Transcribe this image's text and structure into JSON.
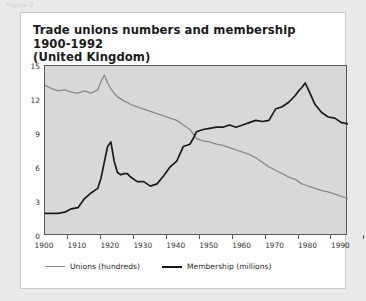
{
  "page": {
    "corner_stub": "Figure 2"
  },
  "card": {
    "title_line1": "Trade unions numbers and membership 1900-1992",
    "title_line2": "(United Kingdom)"
  },
  "legend": {
    "items": [
      {
        "label": "Unions (hundreds)",
        "color": "#8a8a8a",
        "style": "thin"
      },
      {
        "label": "Membership (millions)",
        "color": "#1a1a1a",
        "style": "thick"
      }
    ]
  },
  "colors": {
    "page_background": "#e9e9e9",
    "card_background": "#ffffff",
    "card_border": "#c9c9c9",
    "plot_background": "#d8d8d8",
    "plot_frame": "#5a5a5a",
    "unions_line": "#8a8a8a",
    "membership_line": "#1a1a1a",
    "text": "#1b1b1b"
  },
  "chart_data": {
    "type": "line",
    "title": "Trade unions numbers and membership 1900-1992 (United Kingdom)",
    "subtitle": "(United Kingdom)",
    "xlabel": "",
    "ylabel": "",
    "xlim": [
      1900,
      1992
    ],
    "ylim": [
      0,
      15
    ],
    "grid": false,
    "legend_position": "bottom-left",
    "xticks": [
      1900,
      1910,
      1920,
      1930,
      1940,
      1950,
      1960,
      1970,
      1980,
      1990
    ],
    "yticks": [
      0,
      3,
      6,
      9,
      12,
      15
    ],
    "x": [
      1900,
      1902,
      1904,
      1906,
      1908,
      1910,
      1912,
      1914,
      1916,
      1917,
      1918,
      1919,
      1920,
      1921,
      1922,
      1923,
      1924,
      1925,
      1926,
      1928,
      1930,
      1932,
      1934,
      1936,
      1938,
      1940,
      1942,
      1944,
      1945,
      1946,
      1948,
      1950,
      1952,
      1954,
      1956,
      1958,
      1960,
      1962,
      1964,
      1966,
      1968,
      1970,
      1972,
      1974,
      1976,
      1977,
      1978,
      1979,
      1980,
      1982,
      1984,
      1986,
      1988,
      1990,
      1992
    ],
    "series": [
      {
        "name": "Unions (hundreds)",
        "units": "hundreds",
        "color": "#8a8a8a",
        "values": [
          13.3,
          13.0,
          12.8,
          12.9,
          12.7,
          12.6,
          12.8,
          12.6,
          12.9,
          13.6,
          14.2,
          13.5,
          13.0,
          12.6,
          12.3,
          12.1,
          11.9,
          11.8,
          11.6,
          11.4,
          11.2,
          11.0,
          10.8,
          10.6,
          10.4,
          10.2,
          9.8,
          9.4,
          9.0,
          8.6,
          8.4,
          8.3,
          8.1,
          8.0,
          7.8,
          7.6,
          7.4,
          7.2,
          6.9,
          6.5,
          6.1,
          5.8,
          5.5,
          5.2,
          5.0,
          4.8,
          4.6,
          4.5,
          4.4,
          4.2,
          4.0,
          3.9,
          3.7,
          3.5,
          3.3
        ]
      },
      {
        "name": "Membership (millions)",
        "units": "millions",
        "color": "#1a1a1a",
        "values": [
          2.0,
          2.0,
          2.0,
          2.1,
          2.4,
          2.5,
          3.3,
          3.8,
          4.2,
          5.1,
          6.5,
          7.9,
          8.3,
          6.6,
          5.6,
          5.4,
          5.5,
          5.5,
          5.2,
          4.8,
          4.8,
          4.4,
          4.6,
          5.3,
          6.1,
          6.6,
          7.9,
          8.1,
          8.6,
          9.2,
          9.4,
          9.5,
          9.6,
          9.6,
          9.8,
          9.6,
          9.8,
          10.0,
          10.2,
          10.1,
          10.2,
          11.2,
          11.4,
          11.8,
          12.4,
          12.8,
          13.1,
          13.5,
          12.9,
          11.6,
          10.9,
          10.5,
          10.4,
          10.0,
          9.9
        ]
      }
    ],
    "annotations": [
      {
        "label": "Unions peak",
        "year": 1917,
        "value": 14.2,
        "series": "Unions (hundreds)"
      },
      {
        "label": "Membership post-WWI peak",
        "year": 1920,
        "value": 8.3,
        "series": "Membership (millions)"
      },
      {
        "label": "Series crossover",
        "year": 1943,
        "value": 9.0
      },
      {
        "label": "Membership all-time peak",
        "year": 1979,
        "value": 13.5,
        "series": "Membership (millions)"
      }
    ]
  }
}
